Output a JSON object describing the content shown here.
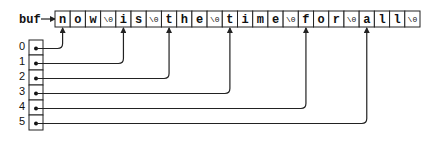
{
  "buffer": {
    "label": "buf",
    "cells": [
      "n",
      "o",
      "w",
      "\\0",
      "i",
      "s",
      "\\0",
      "t",
      "h",
      "e",
      "\\0",
      "t",
      "i",
      "m",
      "e",
      "\\0",
      "f",
      "o",
      "r",
      "\\0",
      "a",
      "l",
      "l",
      "\\0"
    ]
  },
  "pointers": {
    "indices": [
      "0",
      "1",
      "2",
      "3",
      "4",
      "5"
    ],
    "targets": [
      0,
      4,
      7,
      11,
      16,
      20
    ]
  },
  "style": {
    "stroke": "#222222",
    "background": "#ffffff"
  }
}
